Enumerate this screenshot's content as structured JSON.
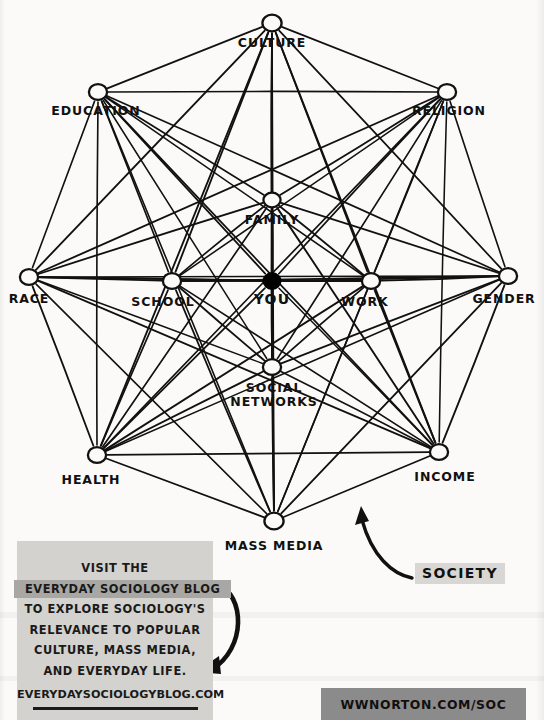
{
  "diagram": {
    "center_node": {
      "id": "you",
      "label": "YOU",
      "x": 272,
      "y": 281,
      "filled": true,
      "r": 8.5
    },
    "nodes": [
      {
        "id": "culture",
        "label": "CULTURE",
        "x": 272,
        "y": 23,
        "r": 9,
        "label_x": 272,
        "label_y": 36
      },
      {
        "id": "education",
        "label": "EDUCATION",
        "x": 98,
        "y": 92,
        "r": 8.5,
        "label_x": 96,
        "label_y": 104
      },
      {
        "id": "religion",
        "label": "RELIGION",
        "x": 447,
        "y": 92,
        "r": 8.5,
        "label_x": 449,
        "label_y": 104
      },
      {
        "id": "family",
        "label": "FAMILY",
        "x": 272,
        "y": 200,
        "r": 8,
        "label_x": 272,
        "label_y": 213
      },
      {
        "id": "race",
        "label": "RACE",
        "x": 29,
        "y": 277,
        "r": 8.5,
        "label_x": 29,
        "label_y": 292
      },
      {
        "id": "school",
        "label": "SCHOOL",
        "x": 172,
        "y": 281,
        "r": 8.5,
        "label_x": 163,
        "label_y": 295
      },
      {
        "id": "work",
        "label": "WORK",
        "x": 371,
        "y": 281,
        "r": 8.5,
        "label_x": 365,
        "label_y": 295
      },
      {
        "id": "gender",
        "label": "GENDER",
        "x": 508,
        "y": 276,
        "r": 8.5,
        "label_x": 504,
        "label_y": 292
      },
      {
        "id": "social_networks",
        "label": "SOCIAL\nNETWORKS",
        "x": 272,
        "y": 367,
        "r": 8.5,
        "label_x": 274,
        "label_y": 381
      },
      {
        "id": "health",
        "label": "HEALTH",
        "x": 97,
        "y": 455,
        "r": 8.5,
        "label_x": 91,
        "label_y": 473
      },
      {
        "id": "income",
        "label": "INCOME",
        "x": 439,
        "y": 452,
        "r": 8.5,
        "label_x": 445,
        "label_y": 470
      },
      {
        "id": "mass_media",
        "label": "MASS MEDIA",
        "x": 274,
        "y": 521,
        "r": 9,
        "label_x": 274,
        "label_y": 539
      }
    ],
    "edges_description": "every node connected to every other node, including the center YOU node",
    "ink_color": "#111111",
    "you_fill_color": "#000000"
  },
  "society_annotation": {
    "label": "SOCIETY",
    "highlight_color": "#d8d7d3",
    "arrow": "curved-arrow-up-left"
  },
  "caption_card": {
    "background_color": "#d3d2ce",
    "highlight_color": "#a8a7a3",
    "lines": [
      {
        "text": "VISIT THE",
        "highlighted": false
      },
      {
        "text": "EVERYDAY SOCIOLOGY BLOG",
        "highlighted": true
      },
      {
        "text": "TO EXPLORE SOCIOLOGY'S",
        "highlighted": false
      },
      {
        "text": "RELEVANCE TO POPULAR",
        "highlighted": false
      },
      {
        "text": "CULTURE, MASS MEDIA,",
        "highlighted": false
      },
      {
        "text": "AND EVERYDAY LIFE.",
        "highlighted": false
      }
    ],
    "url": "EVERYDAYSOCIOLOGYBLOG.COM",
    "arrow": "curved-arrow-down-left"
  },
  "publisher_band": {
    "text": "WWNORTON.COM/SOC",
    "background_color": "#8b8b8b"
  }
}
